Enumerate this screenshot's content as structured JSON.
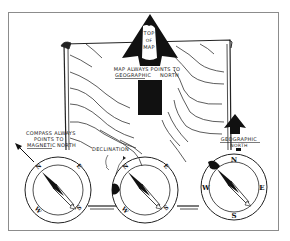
{
  "diagram": {
    "arrow_label": [
      "TOP",
      "OF",
      "MAP"
    ],
    "map_caption": {
      "line1": "MAP ALWAYS POINTS TO",
      "line2_underlined": "GEOGRAPHIC",
      "line2_rest": "NORTH"
    },
    "compass_caption": {
      "line1": "COMPASS ALWAYS",
      "line2": "POINTS TO",
      "line3_underlined": "MAGNETIC",
      "line3_rest": "NORTH"
    },
    "declination_label": "DECLINATION",
    "geographic_north_label": {
      "line1": "GEOGRAPHIC",
      "line2": "NORTH"
    },
    "compass_left": {
      "n": "N",
      "e": "E",
      "s": "S",
      "w": "W"
    },
    "compass_middle": {
      "n": "N",
      "e": "E",
      "s": "S",
      "w": "W"
    },
    "compass_right": {
      "n": "N",
      "e": "E",
      "s": "S",
      "w": "W"
    },
    "colors": {
      "ink": "#111111",
      "frame": "#9a9a9a",
      "paper": "#ffffff"
    }
  }
}
